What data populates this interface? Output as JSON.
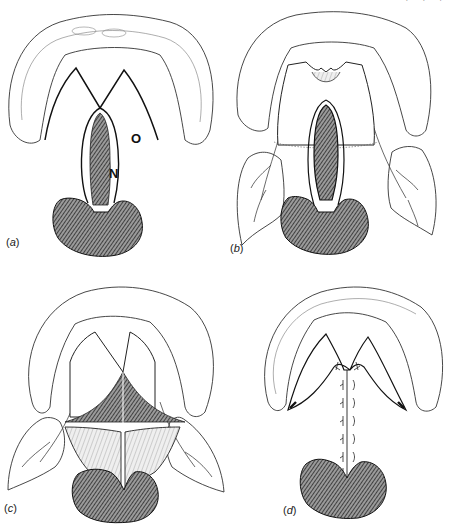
{
  "figure": {
    "cropped_header_fragment": "· · ·",
    "panels": [
      {
        "id": "a",
        "label": "(a)",
        "label_letter": "a",
        "annotations": [
          {
            "text": "O"
          },
          {
            "text": "N"
          }
        ]
      },
      {
        "id": "b",
        "label": "(b)",
        "label_letter": "b"
      },
      {
        "id": "c",
        "label": "(c)",
        "label_letter": "c"
      },
      {
        "id": "d",
        "label": "(d)",
        "label_letter": "d"
      }
    ]
  },
  "colors": {
    "ink": "#1a1a1a",
    "hatch_fill": "#6e6e6e",
    "light_fill": "#ffffff"
  }
}
